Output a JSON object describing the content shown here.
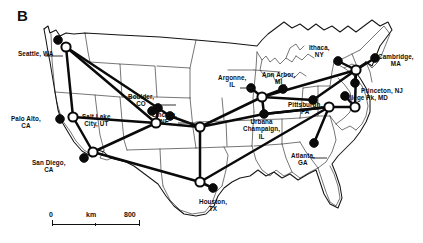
{
  "figure": {
    "panel_label": "B",
    "type": "network-map",
    "region": "Contiguous United States"
  },
  "scalebar": {
    "left_label": "0",
    "unit_label": "km",
    "right_label": "800"
  },
  "nodes": [
    {
      "id": "seattle",
      "label": "Seattle, WA",
      "x": 66,
      "y": 47,
      "open": true,
      "filled_companion": {
        "x": 58,
        "y": 40
      },
      "label_x": 18,
      "label_y": 50,
      "leader": [
        [
          45,
          56
        ],
        [
          63,
          56
        ]
      ]
    },
    {
      "id": "palo-alto",
      "label": "Palo Alto,\nCA",
      "x": 73,
      "y": 117,
      "open": true,
      "filled_companion": {
        "x": 60,
        "y": 119
      },
      "label_x": 11,
      "label_y": 115,
      "leader": null
    },
    {
      "id": "san-diego",
      "label": "San Diego,\nCA",
      "x": 93,
      "y": 152,
      "open": true,
      "filled_companion": {
        "x": 84,
        "y": 158
      },
      "label_x": 32,
      "label_y": 159,
      "leader": null
    },
    {
      "id": "salt-lake",
      "label": "Salt Lake\nCity, UT",
      "x": 156,
      "y": 123,
      "open": true,
      "filled_companion": {
        "x": 152,
        "y": 111
      },
      "label_x": 82,
      "label_y": 113,
      "leader": null
    },
    {
      "id": "boulder",
      "label": "Boulder,\nCO",
      "x": 158,
      "y": 108,
      "open": false,
      "filled_companion": null,
      "label_x": 128,
      "label_y": 93,
      "leader": [
        [
          160,
          105
        ],
        [
          176,
          105
        ]
      ]
    },
    {
      "id": "lincoln",
      "label": "Lincoln,\nNE",
      "x": 170,
      "y": 116,
      "open": false,
      "filled_companion": null,
      "label_x": 152,
      "label_y": 111,
      "leader": [
        [
          178,
          123
        ],
        [
          196,
          123
        ]
      ]
    },
    {
      "id": "kansas",
      "label": "",
      "x": 200,
      "y": 127,
      "open": true,
      "filled_companion": null,
      "label_x": 0,
      "label_y": 0,
      "leader": null
    },
    {
      "id": "argonne",
      "label": "Argonne,\nIL",
      "x": 251,
      "y": 88,
      "open": false,
      "filled_companion": null,
      "label_x": 218,
      "label_y": 74,
      "leader": [
        [
          240,
          88
        ],
        [
          253,
          88
        ]
      ]
    },
    {
      "id": "chicago",
      "label": "",
      "x": 262,
      "y": 97,
      "open": true,
      "filled_companion": null,
      "label_x": 0,
      "label_y": 0,
      "leader": null
    },
    {
      "id": "ann-arbor",
      "label": "Ann Arbor,\nMI",
      "x": 283,
      "y": 89,
      "open": false,
      "filled_companion": null,
      "label_x": 262,
      "label_y": 71,
      "leader": [
        [
          285,
          84
        ],
        [
          285,
          88
        ]
      ]
    },
    {
      "id": "urbana",
      "label": "Urbana\nChampaign,\nIL",
      "x": 264,
      "y": 114,
      "open": false,
      "filled_companion": null,
      "label_x": 243,
      "label_y": 118,
      "leader": null
    },
    {
      "id": "pittsburgh",
      "label": "Pittsburgh,\nPA",
      "x": 313,
      "y": 100,
      "open": false,
      "filled_companion": null,
      "label_x": 288,
      "label_y": 101,
      "leader": null
    },
    {
      "id": "ithaca",
      "label": "Ithaca,\nNY",
      "x": 338,
      "y": 61,
      "open": false,
      "filled_companion": null,
      "label_x": 309,
      "label_y": 44,
      "leader": null
    },
    {
      "id": "cambridge",
      "label": "Cambridge,\nMA",
      "x": 375,
      "y": 58,
      "open": false,
      "filled_companion": null,
      "label_x": 378,
      "label_y": 53,
      "leader": null
    },
    {
      "id": "princeton",
      "label": "Princeton, NJ",
      "x": 355,
      "y": 83,
      "open": false,
      "filled_companion": null,
      "label_x": 361,
      "label_y": 87,
      "leader": null
    },
    {
      "id": "college-park",
      "label": "College Pk, MD",
      "x": 345,
      "y": 96,
      "open": false,
      "filled_companion": null,
      "label_x": 341,
      "label_y": 94,
      "leader": null
    },
    {
      "id": "ny-hub",
      "label": "",
      "x": 356,
      "y": 70,
      "open": true,
      "filled_companion": null,
      "label_x": 0,
      "label_y": 0,
      "leader": null
    },
    {
      "id": "dc-hub",
      "label": "",
      "x": 355,
      "y": 107,
      "open": true,
      "filled_companion": null,
      "label_x": 0,
      "label_y": 0,
      "leader": null
    },
    {
      "id": "atlanta",
      "label": "Atlanta,\nGA",
      "x": 314,
      "y": 143,
      "open": false,
      "filled_companion": null,
      "label_x": 291,
      "label_y": 152,
      "leader": [
        [
          311,
          158
        ],
        [
          327,
          158
        ]
      ]
    },
    {
      "id": "houston",
      "label": "Houston,\nTX",
      "x": 213,
      "y": 188,
      "open": false,
      "filled_companion": {
        "x": 0,
        "y": 0
      },
      "label_x": 199,
      "label_y": 198,
      "leader": null
    },
    {
      "id": "houston-hub",
      "label": "",
      "x": 200,
      "y": 182,
      "open": true,
      "filled_companion": null,
      "label_x": 0,
      "label_y": 0,
      "leader": null
    },
    {
      "id": "se-hub",
      "label": "",
      "x": 329,
      "y": 107,
      "open": true,
      "filled_companion": null,
      "label_x": 0,
      "label_y": 0,
      "leader": null
    }
  ],
  "node_style": {
    "open_fill": "#ffffff",
    "filled_fill": "#0a0a0a",
    "stroke": "#0a0a0a"
  },
  "links": [
    [
      "seattle",
      "palo-alto"
    ],
    [
      "seattle",
      "salt-lake"
    ],
    [
      "seattle",
      "boulder"
    ],
    [
      "palo-alto",
      "salt-lake"
    ],
    [
      "palo-alto",
      "san-diego"
    ],
    [
      "san-diego",
      "salt-lake"
    ],
    [
      "san-diego",
      "houston-hub"
    ],
    [
      "salt-lake",
      "boulder"
    ],
    [
      "salt-lake",
      "kansas"
    ],
    [
      "boulder",
      "lincoln"
    ],
    [
      "lincoln",
      "kansas"
    ],
    [
      "kansas",
      "chicago"
    ],
    [
      "kansas",
      "urbana"
    ],
    [
      "kansas",
      "houston-hub"
    ],
    [
      "chicago",
      "argonne"
    ],
    [
      "chicago",
      "ann-arbor"
    ],
    [
      "chicago",
      "urbana"
    ],
    [
      "chicago",
      "pittsburgh"
    ],
    [
      "chicago",
      "ny-hub"
    ],
    [
      "urbana",
      "se-hub"
    ],
    [
      "pittsburgh",
      "ny-hub"
    ],
    [
      "ny-hub",
      "ithaca"
    ],
    [
      "ny-hub",
      "cambridge"
    ],
    [
      "ny-hub",
      "princeton"
    ],
    [
      "ny-hub",
      "dc-hub"
    ],
    [
      "dc-hub",
      "college-park"
    ],
    [
      "dc-hub",
      "se-hub"
    ],
    [
      "se-hub",
      "atlanta"
    ],
    [
      "se-hub",
      "houston-hub"
    ],
    [
      "houston-hub",
      "houston"
    ],
    [
      "se-hub",
      "urbana"
    ]
  ],
  "map_style": {
    "border_color": "#141414",
    "state_color": "#2b2b2b",
    "land_fill": "#ffffff"
  }
}
